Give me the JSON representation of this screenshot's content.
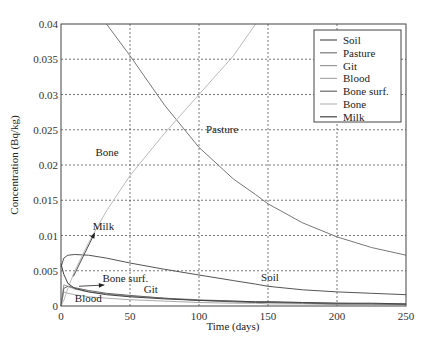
{
  "chart_data": {
    "type": "line",
    "title": "",
    "xlabel": "Time (days)",
    "ylabel": "Concentration (Bq/kg)",
    "xlim": [
      0,
      250
    ],
    "ylim": [
      0,
      0.04
    ],
    "grid": true,
    "legend_position": "upper right",
    "x_ticks": [
      "0",
      "50",
      "100",
      "150",
      "200",
      "250"
    ],
    "y_ticks": [
      "0",
      "0.005",
      "0.01",
      "0.015",
      "0.02",
      "0.025",
      "0.03",
      "0.035",
      "0.04"
    ],
    "x": [
      0,
      2,
      5,
      10,
      20,
      33,
      50,
      75,
      100,
      125,
      141,
      150,
      175,
      200,
      225,
      250
    ],
    "series": [
      {
        "name": "Soil",
        "color": "#555555",
        "values": [
          0.0055,
          0.0068,
          0.0072,
          0.0073,
          0.0072,
          0.0068,
          0.0061,
          0.0052,
          0.0044,
          0.0036,
          0.0031,
          0.0028,
          0.0023,
          0.002,
          0.0018,
          0.0016
        ]
      },
      {
        "name": "Pasture",
        "color": "#777777",
        "values": [
          null,
          null,
          null,
          null,
          null,
          0.04,
          0.0355,
          0.0285,
          0.0225,
          0.018,
          0.0158,
          0.0145,
          0.0118,
          0.0098,
          0.0083,
          0.0072
        ]
      },
      {
        "name": "Git",
        "color": "#999999",
        "values": [
          0.0,
          0.003,
          0.0028,
          0.0024,
          0.002,
          0.0017,
          0.0014,
          0.0011,
          0.0009,
          0.0007,
          0.0006,
          0.0006,
          0.0005,
          0.0004,
          0.0003,
          0.0003
        ]
      },
      {
        "name": "Blood",
        "color": "#aaaaaa",
        "values": [
          0.0,
          0.002,
          0.0018,
          0.0016,
          0.0013,
          0.0011,
          0.0009,
          0.0007,
          0.0005,
          0.0004,
          0.0004,
          0.0003,
          0.0003,
          0.0002,
          0.0002,
          0.0002
        ]
      },
      {
        "name": "Bone surf.",
        "color": "#666666",
        "values": [
          0.0,
          0.0025,
          0.0028,
          0.0026,
          0.0022,
          0.0018,
          0.0015,
          0.0011,
          0.0008,
          0.0006,
          0.0005,
          0.0005,
          0.0004,
          0.0003,
          0.0003,
          0.0002
        ]
      },
      {
        "name": "Bone",
        "color": "#bbbbbb",
        "values": [
          0.0,
          0.0008,
          0.0025,
          0.005,
          0.009,
          0.0135,
          0.0185,
          0.0245,
          0.03,
          0.0355,
          0.04,
          null,
          null,
          null,
          null,
          null
        ]
      },
      {
        "name": "Milk",
        "color": "#444444",
        "values": [
          0.006,
          0.0045,
          0.0032,
          0.0025,
          0.002,
          0.0016,
          0.0013,
          0.001,
          0.0008,
          0.0007,
          0.0006,
          0.0006,
          0.0005,
          0.0004,
          0.0004,
          0.0003
        ]
      }
    ],
    "annotations": [
      {
        "text": "Pasture",
        "x": 105,
        "y": 0.0245
      },
      {
        "text": "Bone",
        "x": 25,
        "y": 0.0213
      },
      {
        "text": "Milk",
        "x": 23,
        "y": 0.0108,
        "arrow_to": [
          9,
          0.0042
        ]
      },
      {
        "text": "Bone surf.",
        "x": 30,
        "y": 0.0034,
        "arrow_to": [
          13,
          0.0028
        ]
      },
      {
        "text": "Git",
        "x": 60,
        "y": 0.0018
      },
      {
        "text": "Soil",
        "x": 145,
        "y": 0.0036
      },
      {
        "text": "Blood",
        "x": 10,
        "y": 0.0006
      }
    ]
  }
}
